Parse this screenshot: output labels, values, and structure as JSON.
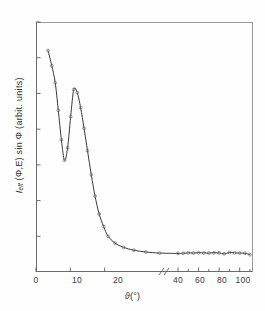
{
  "figure": {
    "background": "#fefefe",
    "ink_color": "#2b2b2b",
    "xlabel_symbol": "ϑ",
    "xlabel_unit": "(°)",
    "ylabel_main": "I",
    "ylabel_sub": "eff",
    "ylabel_rest": " (Φ,E) sin Φ (arbit. units)"
  },
  "chart_data": {
    "type": "line",
    "title": "",
    "xlabel": "ϑ (°)",
    "ylabel": "I_eff (Φ,E) sin Φ (arbit. units)",
    "xlim": [
      0,
      113
    ],
    "ylim": [
      0,
      14
    ],
    "grid": false,
    "legend": false,
    "axis_break": {
      "present": true,
      "symbol": "//",
      "after_value": 37,
      "before_value": 40,
      "note": "x-axis compressed beyond the break; 0-37 linear expanded, 40-113 compressed"
    },
    "xticks": [
      0,
      10,
      20,
      40,
      60,
      80,
      100
    ],
    "xtick_labels": [
      "0",
      "10",
      "20",
      "40",
      "60",
      "80",
      "100"
    ],
    "yticks": [
      2,
      4,
      6,
      8,
      10,
      12,
      14
    ],
    "ytick_labels": [
      "2",
      "4",
      "6",
      "8",
      "10",
      "12",
      "14"
    ],
    "marker": "open-circle",
    "line_style": "solid",
    "series": [
      {
        "name": "I_eff sin Φ",
        "x": [
          3.5,
          4.6,
          5.6,
          6.5,
          7.4,
          8.3,
          9.2,
          10.1,
          11.0,
          12.0,
          13.0,
          14.0,
          15.0,
          16.1,
          17.2,
          18.4,
          19.7,
          21.0,
          23.0,
          25.5,
          28.5,
          32.0,
          36.0,
          40.0,
          45.0,
          50.0,
          55.0,
          60.0,
          65.0,
          70.0,
          75.0,
          80.0,
          85.0,
          90.0,
          95.0,
          100.0,
          105.0,
          110.0
        ],
        "y": [
          12.4,
          11.55,
          10.6,
          9.05,
          7.4,
          6.25,
          6.95,
          8.7,
          10.22,
          10.05,
          9.2,
          8.05,
          6.8,
          5.45,
          4.25,
          3.25,
          2.55,
          2.0,
          1.62,
          1.38,
          1.22,
          1.12,
          1.06,
          1.04,
          1.05,
          1.07,
          1.06,
          1.08,
          1.07,
          1.06,
          1.08,
          1.07,
          1.02,
          1.09,
          1.07,
          1.06,
          1.05,
          0.97
        ]
      }
    ],
    "annotations": []
  }
}
